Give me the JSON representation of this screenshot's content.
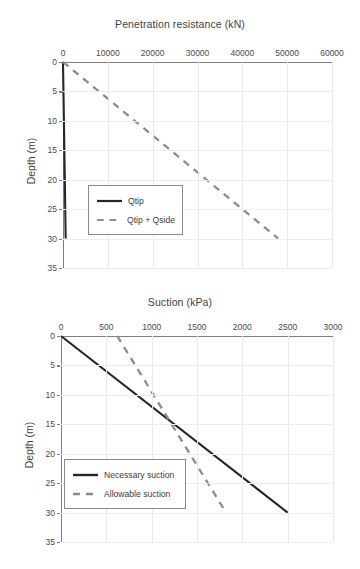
{
  "charts": [
    {
      "id": "penetration-resistance",
      "type": "line",
      "title": "Penetration resistance (kN)",
      "xlabel": "Penetration resistance (kN)",
      "ylabel": "Depth (m)",
      "xticks": [
        "0",
        "10000",
        "20000",
        "30000",
        "40000",
        "50000",
        "60000"
      ],
      "xtick_values": [
        0,
        10000,
        20000,
        30000,
        40000,
        50000,
        60000
      ],
      "yticks": [
        "0",
        "5",
        "10",
        "15",
        "20",
        "25",
        "30",
        "35"
      ],
      "ytick_values": [
        0,
        5,
        10,
        15,
        20,
        25,
        30,
        35
      ],
      "xlim": [
        0,
        60000
      ],
      "ylim": [
        0,
        35
      ],
      "y_inverted": true,
      "grid": true,
      "legend_position": "center-left",
      "series": [
        {
          "name": "Qtip",
          "style": "solid",
          "color": "#262626",
          "x": [
            0,
            600
          ],
          "y": [
            0,
            30
          ]
        },
        {
          "name": "Qtip + Qside",
          "style": "dashed",
          "color": "#8c8c8c",
          "x": [
            0,
            48000
          ],
          "y": [
            0,
            30
          ]
        }
      ]
    },
    {
      "id": "suction",
      "type": "line",
      "title": "Suction (kPa)",
      "xlabel": "Suction (kPa)",
      "ylabel": "Depth (m)",
      "xticks": [
        "0",
        "500",
        "1000",
        "1500",
        "2000",
        "2500",
        "3000"
      ],
      "xtick_values": [
        0,
        500,
        1000,
        1500,
        2000,
        2500,
        3000
      ],
      "yticks": [
        "0",
        "5",
        "10",
        "15",
        "20",
        "25",
        "30",
        "35"
      ],
      "ytick_values": [
        0,
        5,
        10,
        15,
        20,
        25,
        30,
        35
      ],
      "xlim": [
        0,
        3000
      ],
      "ylim": [
        0,
        35
      ],
      "y_inverted": true,
      "grid": true,
      "legend_position": "lower-left",
      "series": [
        {
          "name": "Necessary suction",
          "style": "solid",
          "color": "#262626",
          "x": [
            0,
            2500
          ],
          "y": [
            0,
            30
          ]
        },
        {
          "name": "Allowable suction",
          "style": "dashed",
          "color": "#8c8c8c",
          "x": [
            620,
            1820
          ],
          "y": [
            0,
            30
          ]
        }
      ]
    }
  ]
}
